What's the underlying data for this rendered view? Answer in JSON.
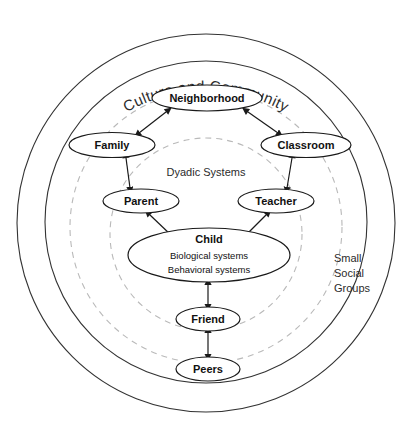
{
  "diagram": {
    "title": "Culture and Community",
    "rings": [
      {
        "name": "culture-and-community",
        "label": "Culture and Community",
        "style": "solid"
      },
      {
        "name": "small-social-groups",
        "label": "Small\nSocial\nGroups",
        "style": "solid"
      },
      {
        "name": "dyadic-systems",
        "label": "Dyadic Systems",
        "style": "dashed"
      },
      {
        "name": "inner-dyadic",
        "label": "",
        "style": "dashed"
      }
    ],
    "ring_labels": {
      "culture_and_community": "Culture and Community",
      "small_social_groups_line1": "Small",
      "small_social_groups_line2": "Social",
      "small_social_groups_line3": "Groups",
      "dyadic_systems": "Dyadic Systems"
    },
    "nodes": [
      {
        "id": "neighborhood",
        "label": "Neighborhood"
      },
      {
        "id": "family",
        "label": "Family"
      },
      {
        "id": "classroom",
        "label": "Classroom"
      },
      {
        "id": "parent",
        "label": "Parent"
      },
      {
        "id": "teacher",
        "label": "Teacher"
      },
      {
        "id": "child",
        "label": "Child",
        "sublabels": [
          "Biological systems",
          "Behavioral systems"
        ]
      },
      {
        "id": "friend",
        "label": "Friend"
      },
      {
        "id": "peers",
        "label": "Peers"
      }
    ],
    "node_labels": {
      "neighborhood": "Neighborhood",
      "family": "Family",
      "classroom": "Classroom",
      "parent": "Parent",
      "teacher": "Teacher",
      "child": "Child",
      "child_sub1": "Biological systems",
      "child_sub2": "Behavioral systems",
      "friend": "Friend",
      "peers": "Peers"
    },
    "connections": [
      {
        "from": "neighborhood",
        "to": "family",
        "arrow": "double"
      },
      {
        "from": "neighborhood",
        "to": "classroom",
        "arrow": "double"
      },
      {
        "from": "family",
        "to": "parent",
        "arrow": "double"
      },
      {
        "from": "classroom",
        "to": "teacher",
        "arrow": "double"
      },
      {
        "from": "parent",
        "to": "child",
        "arrow": "double"
      },
      {
        "from": "teacher",
        "to": "child",
        "arrow": "double"
      },
      {
        "from": "child",
        "to": "friend",
        "arrow": "double"
      },
      {
        "from": "friend",
        "to": "peers",
        "arrow": "double"
      }
    ],
    "colors": {
      "solid_ring": "#333333",
      "dashed_ring": "#b9b9b9",
      "node_stroke": "#1a1a1a",
      "text": "#111111",
      "background": "#ffffff"
    }
  }
}
